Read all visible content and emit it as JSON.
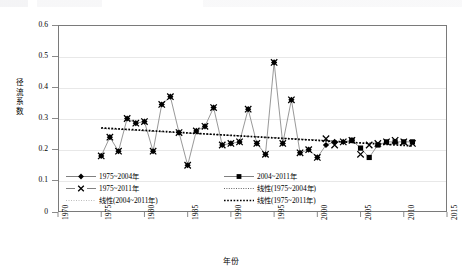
{
  "chart_data": {
    "type": "scatter",
    "title": "",
    "xlabel": "年份",
    "ylabel": "径流系数",
    "xlim": [
      1970,
      2015
    ],
    "ylim": [
      0,
      0.6
    ],
    "xticks": [
      "1970",
      "1975",
      "1980",
      "1985",
      "1990",
      "1995",
      "2000",
      "2005",
      "2010",
      "2015"
    ],
    "yticks": [
      "0",
      "0.1",
      "0.2",
      "0.3",
      "0.4",
      "0.5",
      "0.6"
    ],
    "grid": "horizontal",
    "legend_position": "inside-bottom",
    "series": [
      {
        "name": "1975~2004年",
        "marker": "diamond",
        "line": "solid",
        "x": [
          1975,
          1976,
          1977,
          1978,
          1979,
          1980,
          1981,
          1982,
          1983,
          1984,
          1985,
          1986,
          1987,
          1988,
          1989,
          1990,
          1991,
          1992,
          1993,
          1994,
          1995,
          1996,
          1997,
          1998,
          1999,
          2000,
          2001,
          2002,
          2003,
          2004
        ],
        "values": [
          0.18,
          0.24,
          0.195,
          0.3,
          0.285,
          0.29,
          0.195,
          0.345,
          0.37,
          0.255,
          0.15,
          0.26,
          0.275,
          0.335,
          0.215,
          0.22,
          0.225,
          0.33,
          0.22,
          0.185,
          0.48,
          0.22,
          0.36,
          0.19,
          0.2,
          0.175,
          0.215,
          0.225,
          0.225,
          0.23
        ]
      },
      {
        "name": "2004~2011年",
        "marker": "square",
        "line": "solid",
        "x": [
          2004,
          2005,
          2006,
          2007,
          2008,
          2009,
          2010,
          2011
        ],
        "values": [
          0.23,
          0.205,
          0.175,
          0.215,
          0.225,
          0.225,
          0.225,
          0.225
        ]
      },
      {
        "name": "1975~2011年",
        "marker": "cross",
        "line": "none",
        "x": [
          1975,
          1976,
          1977,
          1978,
          1979,
          1980,
          1981,
          1982,
          1983,
          1984,
          1985,
          1986,
          1987,
          1988,
          1989,
          1990,
          1991,
          1992,
          1993,
          1994,
          1995,
          1996,
          1997,
          1998,
          1999,
          2000,
          2001,
          2002,
          2003,
          2004,
          2005,
          2006,
          2007,
          2008,
          2009,
          2010,
          2011
        ],
        "values": [
          0.18,
          0.24,
          0.195,
          0.3,
          0.285,
          0.29,
          0.195,
          0.345,
          0.37,
          0.255,
          0.15,
          0.26,
          0.275,
          0.335,
          0.215,
          0.22,
          0.225,
          0.33,
          0.22,
          0.185,
          0.48,
          0.22,
          0.36,
          0.19,
          0.2,
          0.175,
          0.235,
          0.215,
          0.225,
          0.23,
          0.185,
          0.215,
          0.22,
          0.225,
          0.23,
          0.225,
          0.22
        ]
      }
    ],
    "trendlines": [
      {
        "name": "线性(1975~2004年)",
        "style": "dotted-fine",
        "x": [
          1975,
          2004
        ],
        "values": [
          0.268,
          0.225
        ]
      },
      {
        "name": "线性(2004~2011年)",
        "style": "dotted-light",
        "x": [
          2004,
          2011
        ],
        "values": [
          0.222,
          0.214
        ]
      },
      {
        "name": "线性(1975~2011年)",
        "style": "dotted-bold",
        "x": [
          1975,
          2011
        ],
        "values": [
          0.27,
          0.212
        ]
      }
    ],
    "legend": [
      {
        "label": "1975~2004年",
        "marker": "diamond",
        "line": "solid"
      },
      {
        "label": "2004~2011年",
        "marker": "square",
        "line": "solid"
      },
      {
        "label": "1975~2011年",
        "marker": "cross",
        "line": "none"
      },
      {
        "label": "线性(1975~2004年)",
        "marker": "none",
        "line": "dotted-fine"
      },
      {
        "label": "线性(2004~2011年)",
        "marker": "none",
        "line": "dotted-light"
      },
      {
        "label": "线性(1975~2011年)",
        "marker": "none",
        "line": "dotted-bold"
      }
    ],
    "colors": {
      "marker": "#000000",
      "series_line": "#808080",
      "trend": "#000000",
      "grid": "#e8e8e8",
      "frame": "#7a7a7a"
    }
  }
}
